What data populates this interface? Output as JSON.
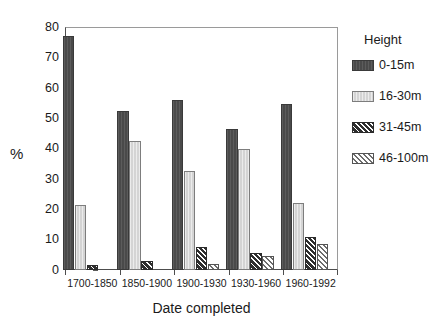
{
  "chart_data": {
    "type": "bar",
    "title": "",
    "xlabel": "Date completed",
    "ylabel": "%",
    "ylim": [
      0,
      80
    ],
    "yticks": [
      0,
      10,
      20,
      30,
      40,
      50,
      60,
      70,
      80
    ],
    "grid": false,
    "legend_position": "right",
    "legend_title": "Height",
    "categories": [
      "1700-1850",
      "1850-1900",
      "1900-1930",
      "1930-1960",
      "1960-1992"
    ],
    "series": [
      {
        "name": "0-15m",
        "values": [
          77.0,
          52.5,
          56.0,
          46.5,
          54.5
        ]
      },
      {
        "name": "16-30m",
        "values": [
          21.5,
          42.5,
          32.5,
          40.0,
          22.0
        ]
      },
      {
        "name": "31-45m",
        "values": [
          1.5,
          3.0,
          7.5,
          5.5,
          11.0
        ]
      },
      {
        "name": "46-100m",
        "values": [
          0.0,
          0.0,
          2.0,
          4.5,
          8.5
        ]
      }
    ]
  },
  "legend": {
    "title": "Height",
    "items": [
      {
        "label": "0-15m",
        "swatch": "solid-dark-gray"
      },
      {
        "label": "16-30m",
        "swatch": "solid-light-gray"
      },
      {
        "label": "31-45m",
        "swatch": "hatched-dark"
      },
      {
        "label": "46-100m",
        "swatch": "hatched-white"
      }
    ]
  },
  "colors": {
    "series_0_15m": "#4a4a4a",
    "series_16_30m": "#d4d4d4",
    "series_31_45m": "#3c3c3c",
    "series_46_100m": "#ffffff",
    "axis": "#4d4d4d",
    "text": "#1a1a1a",
    "background": "#ffffff"
  }
}
